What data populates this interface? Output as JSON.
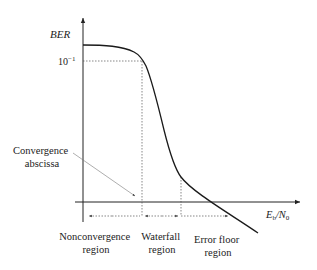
{
  "diagram": {
    "y_axis": {
      "label": "BER",
      "tick_label_base": "10",
      "tick_label_exp": "−1"
    },
    "x_axis": {
      "label_main": "E",
      "label_sub1": "b",
      "label_slash": "/N",
      "label_sub2": "0"
    },
    "annotation": {
      "line1": "Convergence",
      "line2": "abscissa"
    },
    "regions": [
      {
        "line1": "Nonconvergence",
        "line2": "region"
      },
      {
        "line1": "Waterfall",
        "line2": "region"
      },
      {
        "line1": "Error floor",
        "line2": "region"
      }
    ],
    "colors": {
      "curve": "#1a1a1a",
      "axis": "#222222",
      "guide": "#555555",
      "text": "#222222"
    }
  }
}
